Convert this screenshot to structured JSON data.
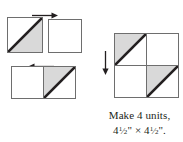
{
  "figure": {
    "type": "quilt-block-assembly-diagram",
    "colors": {
      "outline": "#6e6e6e",
      "seam": "#231f20",
      "shaded_triangle": "#d9d9d9",
      "background": "#ffffff",
      "text": "#231f20",
      "arrow": "#231f20"
    },
    "steps": [
      {
        "name": "step-1",
        "squares": [
          {
            "name": "half-square-triangle-a",
            "diagonal": "bottom-left-to-top-right",
            "shaded_half": "lower-right"
          },
          {
            "name": "plain-square-a",
            "diagonal": "none",
            "shaded_half": "none"
          }
        ],
        "arrow": {
          "name": "join-arrow-right",
          "direction": "right"
        }
      },
      {
        "name": "step-2",
        "squares": [
          {
            "name": "plain-square-b",
            "diagonal": "none",
            "shaded_half": "none"
          },
          {
            "name": "half-square-triangle-b",
            "diagonal": "bottom-left-to-top-right",
            "shaded_half": "upper-left"
          }
        ],
        "arrow": {
          "name": "join-arrow-left",
          "direction": "left"
        }
      }
    ],
    "unit": {
      "name": "finished-unit",
      "arrow": {
        "name": "assemble-arrow-down",
        "direction": "down"
      },
      "quadrants": [
        {
          "name": "unit-top-left",
          "diagonal": "bottom-left-to-top-right",
          "shaded_half": "upper-left"
        },
        {
          "name": "unit-top-right",
          "diagonal": "none",
          "shaded_half": "none"
        },
        {
          "name": "unit-bottom-left",
          "diagonal": "none",
          "shaded_half": "none"
        },
        {
          "name": "unit-bottom-right",
          "diagonal": "bottom-left-to-top-right",
          "shaded_half": "upper-left"
        }
      ]
    },
    "caption": {
      "line1": "Make 4 units,",
      "line2_whole_first": "4",
      "line2_frac_num": "1",
      "line2_frac_den": "2",
      "line2_inch_first": "\"",
      "line2_times": " × ",
      "line2_whole_second": "4",
      "line2_frac_num2": "1",
      "line2_frac_den2": "2",
      "line2_inch_second": "\".",
      "line2_plain": "4½\" × 4½\"."
    }
  }
}
